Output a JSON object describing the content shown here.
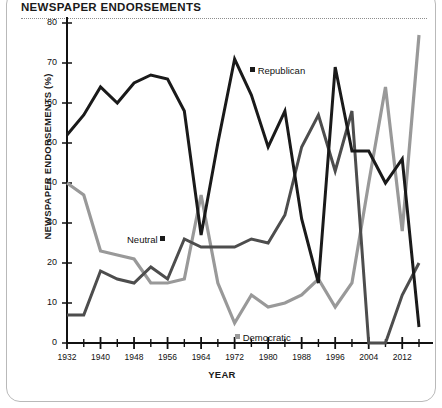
{
  "title": "NEWSPAPER ENDORSEMENTS",
  "axes": {
    "ylabel": "NEWSPAPER ENDORSEMENTS (%)",
    "xlabel": "YEAR"
  },
  "colors": {
    "republican": "#1a1a1a",
    "neutral": "#4d4d4d",
    "democratic": "#999999",
    "border": "#b9b9b9",
    "rule": "#8d8d8d"
  },
  "legend": {
    "republican": "Republican",
    "neutral": "Neutral",
    "democratic": "Democratic"
  },
  "chart_data": {
    "type": "line",
    "title": "NEWSPAPER ENDORSEMENTS",
    "xlabel": "YEAR",
    "ylabel": "NEWSPAPER ENDORSEMENTS (%)",
    "xlim": [
      1932,
      2016
    ],
    "ylim": [
      0,
      80
    ],
    "yticks": [
      0,
      10,
      20,
      30,
      40,
      50,
      60,
      70,
      80
    ],
    "ytick_labels": [
      "0",
      "10",
      "20",
      "30",
      "40",
      "50",
      "60",
      "70",
      "80"
    ],
    "xticks": [
      1932,
      1936,
      1940,
      1944,
      1948,
      1952,
      1956,
      1960,
      1964,
      1968,
      1972,
      1976,
      1980,
      1984,
      1988,
      1992,
      1996,
      2000,
      2004,
      2008,
      2012,
      2016
    ],
    "xtick_labels_shown": [
      "1932",
      "1940",
      "1948",
      "1956",
      "1964",
      "1972",
      "1980",
      "1988",
      "1996",
      "2004",
      "2012"
    ],
    "grid": false,
    "legend_position": "inline-annotations",
    "x": [
      1932,
      1936,
      1940,
      1944,
      1948,
      1952,
      1956,
      1960,
      1964,
      1968,
      1972,
      1976,
      1980,
      1984,
      1988,
      1992,
      1996,
      2000,
      2004,
      2008,
      2012,
      2016
    ],
    "series": [
      {
        "name": "Republican",
        "color": "#1a1a1a",
        "values": [
          52,
          57,
          64,
          60,
          65,
          67,
          66,
          58,
          27,
          50,
          71,
          62,
          49,
          58,
          31,
          15,
          69,
          48,
          48,
          40,
          46,
          4
        ]
      },
      {
        "name": "Neutral",
        "color": "#4d4d4d",
        "values": [
          7,
          7,
          18,
          16,
          15,
          19,
          16,
          26,
          24,
          24,
          24,
          26,
          25,
          32,
          49,
          57,
          43,
          58,
          0,
          0,
          12,
          20
        ]
      },
      {
        "name": "Democratic",
        "color": "#999999",
        "values": [
          40,
          37,
          23,
          22,
          21,
          15,
          15,
          16,
          37,
          15,
          5,
          12,
          9,
          10,
          12,
          16,
          9,
          15,
          40,
          64,
          28,
          77
        ]
      }
    ]
  }
}
